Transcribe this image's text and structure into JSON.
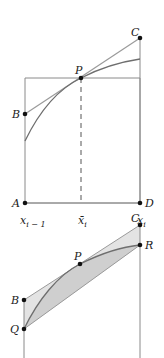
{
  "colors": {
    "line": "#8a8a8a",
    "curve": "#6e6e6e",
    "point": "#111111",
    "text": "#222222",
    "fill_light": "#e3e3e3",
    "fill_dark": "#cfcfcf"
  },
  "top_diagram": {
    "points": {
      "A": {
        "label": "A",
        "x": 25,
        "y": 203
      },
      "B": {
        "label": "B",
        "x": 25,
        "y": 114
      },
      "C": {
        "label": "C",
        "x": 140,
        "y": 38
      },
      "D": {
        "label": "D",
        "x": 140,
        "y": 203
      },
      "P": {
        "label": "P",
        "x": 81,
        "y": 78
      }
    },
    "axis_labels": {
      "left": {
        "main": "x",
        "sub": "i − 1"
      },
      "mid": {
        "main": "x̄",
        "sub": "i"
      },
      "right": {
        "main": "x",
        "sub": "i"
      }
    }
  },
  "bottom_diagram": {
    "points": {
      "B": {
        "label": "B",
        "x": 24,
        "y": 300
      },
      "Q": {
        "label": "Q",
        "x": 24,
        "y": 329
      },
      "P": {
        "label": "P",
        "x": 80,
        "y": 264
      },
      "C": {
        "label": "C",
        "x": 140,
        "y": 225
      },
      "R": {
        "label": "R",
        "x": 140,
        "y": 245
      }
    }
  }
}
